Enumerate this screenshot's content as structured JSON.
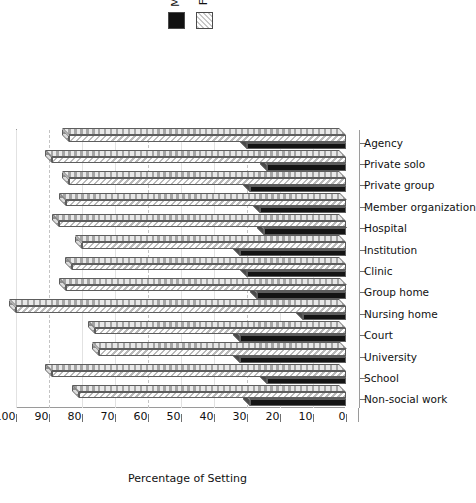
{
  "legend": {
    "position": "top-center",
    "entries": [
      {
        "label": "M",
        "icon": "solid-square-swatch",
        "color": "#141414",
        "pattern": "solid"
      },
      {
        "label": "F",
        "icon": "hatched-square-swatch",
        "color": "#c9c9c9",
        "pattern": "diagonal-hatch"
      }
    ]
  },
  "axis": {
    "value_label": "Percentage of Setting",
    "ticks": [
      "0",
      "10",
      "20",
      "30",
      "40",
      "50",
      "60",
      "70",
      "80",
      "90",
      "100"
    ]
  },
  "chart_data": {
    "type": "bar",
    "title": "",
    "subtitle": "",
    "xlabel": "",
    "ylabel": "Percentage of Setting",
    "ylim": [
      0,
      100
    ],
    "grid": true,
    "orientation": "vertical-3d-rotated",
    "legend_position": "top-center",
    "categories": [
      "Non-social work",
      "School",
      "University",
      "Court",
      "Nursing home",
      "Group home",
      "Clinic",
      "Institution",
      "Hospital",
      "Member organization",
      "Private group",
      "Private solo",
      "Agency"
    ],
    "series": [
      {
        "name": "M",
        "values": [
          29,
          24,
          32,
          32,
          13,
          27,
          30,
          32,
          25,
          26,
          29,
          24,
          30
        ]
      },
      {
        "name": "F",
        "values": [
          81,
          89,
          75,
          76,
          100,
          85,
          83,
          80,
          87,
          85,
          84,
          89,
          84
        ]
      }
    ]
  }
}
